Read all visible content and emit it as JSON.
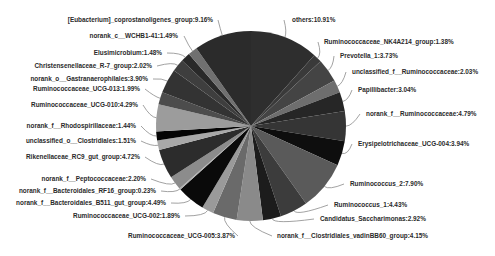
{
  "chart_data": {
    "type": "pie",
    "title": "",
    "start_angle_deg": 0,
    "direction": "clockwise",
    "center": [
      251,
      126
    ],
    "radius": 95,
    "slices": [
      {
        "label": "others",
        "value": 10.91,
        "color": "#2e2e2e",
        "text_pos": [
          292,
          22
        ],
        "anchor": "start",
        "leader_to": [
          284,
          22
        ]
      },
      {
        "label": "Ruminococcaceae_NK4A214_group",
        "value": 1.38,
        "color": "#3a3a3a",
        "text_pos": [
          324,
          44
        ],
        "anchor": "start",
        "leader_to": [
          318,
          44
        ]
      },
      {
        "label": "Prevotella_1",
        "value": 3.73,
        "color": "#444444",
        "text_pos": [
          340,
          58
        ],
        "anchor": "start",
        "leader_to": [
          334,
          58
        ]
      },
      {
        "label": "unclassified_f__Ruminococcaceae",
        "value": 2.03,
        "color": "#6e6e6e",
        "text_pos": [
          352,
          74
        ],
        "anchor": "start",
        "leader_to": [
          346,
          74
        ]
      },
      {
        "label": "Papillibacter",
        "value": 3.04,
        "color": "#262626",
        "text_pos": [
          358,
          92
        ],
        "anchor": "start",
        "leader_to": [
          352,
          92
        ]
      },
      {
        "label": "norank_f__Ruminococcaceae",
        "value": 4.79,
        "color": "#353535",
        "text_pos": [
          366,
          116
        ],
        "anchor": "start",
        "leader_to": [
          360,
          116
        ]
      },
      {
        "label": "Erysipelotrichaceae_UCG-004",
        "value": 3.94,
        "color": "#0e0e0e",
        "text_pos": [
          358,
          146
        ],
        "anchor": "start",
        "leader_to": [
          352,
          146
        ]
      },
      {
        "label": "Ruminococcus_2",
        "value": 7.9,
        "color": "#5a5a5a",
        "text_pos": [
          350,
          186
        ],
        "anchor": "start",
        "leader_to": [
          344,
          186
        ]
      },
      {
        "label": "Ruminococcus_1",
        "value": 4.43,
        "color": "#3c3c3c",
        "text_pos": [
          334,
          207
        ],
        "anchor": "start",
        "leader_to": [
          328,
          207
        ]
      },
      {
        "label": "Candidatus_Saccharimonas",
        "value": 2.92,
        "color": "#1c1c1c",
        "text_pos": [
          320,
          221
        ],
        "anchor": "start",
        "leader_to": [
          314,
          221
        ]
      },
      {
        "label": "norank_f__Clostridiales_vadinBB60_group",
        "value": 4.15,
        "color": "#8a8a8a",
        "text_pos": [
          277,
          238
        ],
        "anchor": "start",
        "leader_to": [
          272,
          238
        ]
      },
      {
        "label": "Ruminococcaceae_UCG-005",
        "value": 3.87,
        "color": "#6a6a6a",
        "text_pos": [
          235,
          238
        ],
        "anchor": "end",
        "leader_to": [
          238,
          238
        ]
      },
      {
        "label": "Ruminococcaceae_UCG-002",
        "value": 1.89,
        "color": "#9a9a9a",
        "text_pos": [
          180,
          218
        ],
        "anchor": "end",
        "leader_to": [
          185,
          218
        ]
      },
      {
        "label": "norank_f__Bacteroidales_B511_gut_group",
        "value": 4.49,
        "color": "#0a0a0a",
        "text_pos": [
          166,
          205
        ],
        "anchor": "end",
        "leader_to": [
          171,
          205
        ]
      },
      {
        "label": "norank_f__Bacteroidales_RF16_group",
        "value": 0.23,
        "color": "#b0b0b0",
        "text_pos": [
          156,
          193
        ],
        "anchor": "end",
        "leader_to": [
          161,
          193
        ]
      },
      {
        "label": "norank_f__Peptococcaceae",
        "value": 2.2,
        "color": "#8c8c8c",
        "text_pos": [
          146,
          181
        ],
        "anchor": "end",
        "leader_to": [
          151,
          181
        ]
      },
      {
        "label": "Rikenellaceae_RC9_gut_group",
        "value": 4.72,
        "color": "#2c2c2c",
        "text_pos": [
          140,
          159
        ],
        "anchor": "end",
        "leader_to": [
          145,
          159
        ]
      },
      {
        "label": "unclassified_o__Clostridiales",
        "value": 1.51,
        "color": "#a8a8a8",
        "text_pos": [
          136,
          143
        ],
        "anchor": "end",
        "leader_to": [
          141,
          143
        ]
      },
      {
        "label": "norank_f__Rhodospirillaceae",
        "value": 1.44,
        "color": "#050505",
        "text_pos": [
          136,
          128
        ],
        "anchor": "end",
        "leader_to": [
          141,
          128
        ]
      },
      {
        "label": "Ruminococcaceae_UCG-010",
        "value": 4.29,
        "color": "#9c9c9c",
        "text_pos": [
          138,
          107
        ],
        "anchor": "end",
        "leader_to": [
          143,
          107
        ]
      },
      {
        "label": "Ruminococcaceae_UCG-013",
        "value": 1.99,
        "color": "#4c4c4c",
        "text_pos": [
          140,
          91
        ],
        "anchor": "end",
        "leader_to": [
          145,
          91
        ]
      },
      {
        "label": "norank_o__Gastranaerophilales",
        "value": 3.9,
        "color": "#333333",
        "text_pos": [
          148,
          81
        ],
        "anchor": "end",
        "leader_to": [
          153,
          81
        ]
      },
      {
        "label": "Christensenellaceae_R-7_group",
        "value": 2.02,
        "color": "#3e3e3e",
        "text_pos": [
          152,
          68
        ],
        "anchor": "end",
        "leader_to": [
          157,
          68
        ]
      },
      {
        "label": "Elusimicrobium",
        "value": 1.48,
        "color": "#292929",
        "text_pos": [
          162,
          55
        ],
        "anchor": "end",
        "leader_to": [
          167,
          55
        ]
      },
      {
        "label": "norank_c__WCHB1-41",
        "value": 1.49,
        "color": "#707070",
        "text_pos": [
          178,
          38
        ],
        "anchor": "end",
        "leader_to": [
          184,
          38
        ]
      },
      {
        "label": "[Eubacterium]_coprostanoligenes_group",
        "value": 9.16,
        "color": "#2b2b2b",
        "text_pos": [
          213,
          22
        ],
        "anchor": "end",
        "leader_to": [
          218,
          22
        ]
      }
    ],
    "legend": "none",
    "display_labels": [
      "others:10.91%",
      "Ruminococcaceae_NK4A214_group:1.38%",
      "Prevotella_1:3.73%",
      "unclassified_f__Ruminococcaceae:2.03%",
      "Papillibacter:3.04%",
      "norank_f__Ruminococcaceae:4.79%",
      "Erysipelotrichaceae_UCG-004:3.94%",
      "Ruminococcus_2:7.90%",
      "Ruminococcus_1:4.43%",
      "Candidatus_Saccharimonas:2.92%",
      "norank_f__Clostridiales_vadinBB60_group:4.15%",
      "Ruminococcaceae_UCG-005:3.87%",
      "Ruminococcaceae_UCG-002:1.89%",
      "norank_f__Bacteroidales_B511_gut_group:4.49%",
      "norank_f__Bacteroidales_RF16_group:0.23%",
      "norank_f__Peptococcaceae:2.20%",
      "Rikenellaceae_RC9_gut_group:4.72%",
      "unclassified_o__Clostridiales:1.51%",
      "norank_f__Rhodospirillaceae:1.44%",
      "Ruminococcaceae_UCG-010:4.29%",
      "Ruminococcaceae_UCG-013:1.99%",
      "norank_o__Gastranaerophilales:3.90%",
      "Christensenellaceae_R-7_group:2.02%",
      "Elusimicrobium:1.48%",
      "norank_c__WCHB1-41:1.49%",
      "[Eubacterium]_coprostanoligenes_group:9.16%"
    ]
  }
}
